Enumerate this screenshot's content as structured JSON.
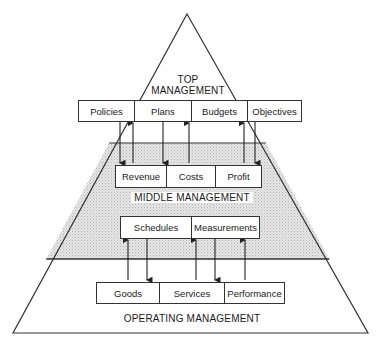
{
  "diagram": {
    "type": "management-pyramid",
    "levels": [
      {
        "name": "top",
        "label_line1": "TOP",
        "label_line2": "MANAGEMENT",
        "items": [
          "Policies",
          "Plans",
          "Budgets",
          "Objectives"
        ]
      },
      {
        "name": "middle",
        "label": "MIDDLE MANAGEMENT",
        "items_upper": [
          "Revenue",
          "Costs",
          "Profit"
        ],
        "items_lower": [
          "Schedules",
          "Measurements"
        ]
      },
      {
        "name": "operating",
        "label": "OPERATING MANAGEMENT",
        "items": [
          "Goods",
          "Services",
          "Performance"
        ]
      }
    ],
    "colors": {
      "line": "#333333",
      "shade": "#d9d9d9",
      "background": "#ffffff"
    }
  }
}
